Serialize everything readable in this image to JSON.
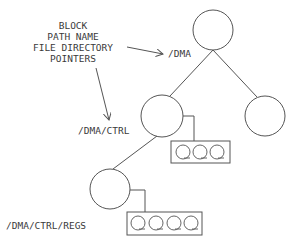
{
  "legend": {
    "lines": [
      "BLOCK",
      "PATH NAME",
      "FILE DIRECTORY",
      "POINTERS"
    ]
  },
  "nodes": {
    "root": {
      "label": "/DMA"
    },
    "ctrl": {
      "label": "/DMA/CTRL"
    },
    "right": {
      "label": ""
    },
    "regs": {
      "label": "/DMA/CTRL/REGS"
    }
  },
  "pointer_blocks": {
    "ctrl_block": {
      "count": 3
    },
    "regs_block": {
      "count": 4
    }
  }
}
